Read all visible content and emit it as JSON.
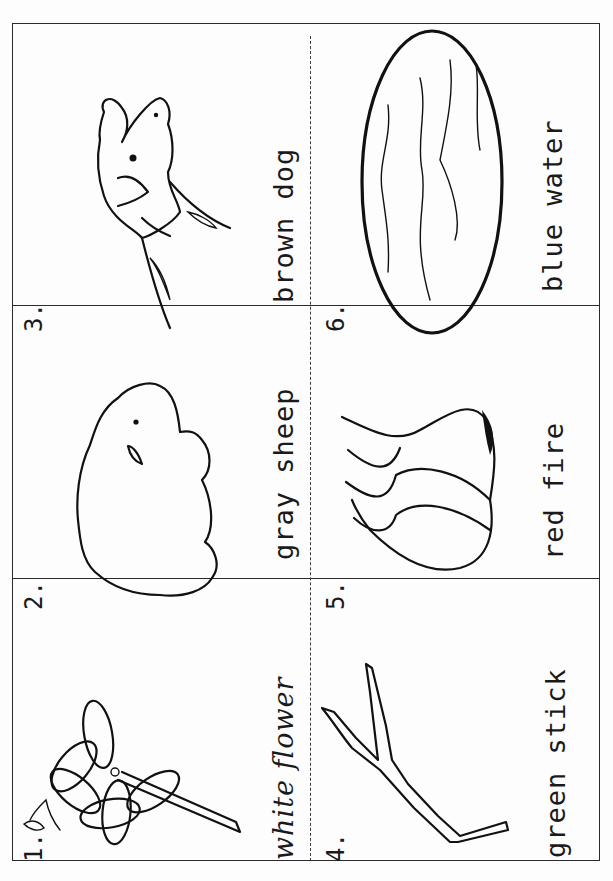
{
  "worksheet": {
    "orientation": "rotated -90deg",
    "cards": [
      {
        "number": "1.",
        "label": "white flower",
        "picture": "flower-icon"
      },
      {
        "number": "2.",
        "label": "gray sheep",
        "picture": "sheep-icon"
      },
      {
        "number": "3.",
        "label": "brown dog",
        "picture": "dog-icon"
      },
      {
        "number": "4.",
        "label": "green stick",
        "picture": "stick-icon"
      },
      {
        "number": "5.",
        "label": "red fire",
        "picture": "fire-icon"
      },
      {
        "number": "6.",
        "label": "blue water",
        "picture": "water-icon"
      }
    ],
    "colors": {
      "ink": "#111111",
      "paper": "#fdfdfd",
      "border": "#2a2a2a"
    }
  }
}
